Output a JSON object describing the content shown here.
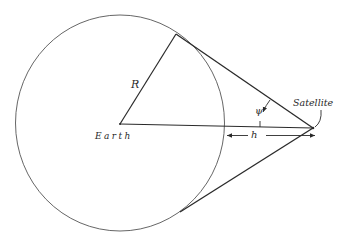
{
  "figure": {
    "labels": {
      "radius": "R",
      "center": "Earth",
      "satellite": "Satellite",
      "altitude": "h",
      "angle": "ψ"
    },
    "colors": {
      "stroke": "#2a2a2a",
      "circle": "#555555",
      "background": "#ffffff"
    }
  }
}
